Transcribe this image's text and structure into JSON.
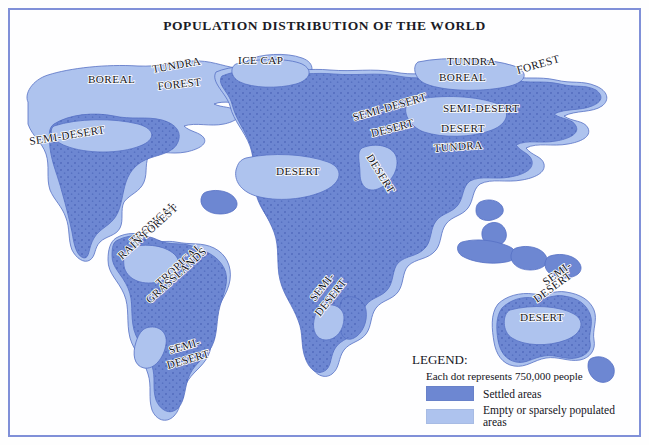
{
  "title": "POPULATION DISTRIBUTION OF THE WORLD",
  "colors": {
    "settled": "#6d87d2",
    "empty": "#aec3ee",
    "border": "#8090d8",
    "outline": "#5570c4",
    "dot": "#4a64b8",
    "background": "#fefeff",
    "text": "#14141c"
  },
  "legend": {
    "heading": "LEGEND:",
    "dot_note": "Each dot represents 750,000 people",
    "items": [
      {
        "label": "Settled areas",
        "color": "#6d87d2"
      },
      {
        "label": "Empty or sparsely populated areas",
        "color": "#aec3ee"
      }
    ]
  },
  "map_labels": [
    {
      "id": "na-boreal",
      "text": "BOREAL",
      "x": 78,
      "y": 41,
      "rot": 0,
      "size": "lg"
    },
    {
      "id": "na-tundra",
      "text": "TUNDRA",
      "x": 143,
      "y": 31,
      "rot": -10,
      "size": "lg"
    },
    {
      "id": "na-forest",
      "text": "FOREST",
      "x": 148,
      "y": 48,
      "rot": -6,
      "size": "lg"
    },
    {
      "id": "na-ice-cap",
      "text": "ICE CAP",
      "x": 228,
      "y": 22,
      "rot": 0,
      "size": "lg"
    },
    {
      "id": "na-semi-desert",
      "text": "SEMI-DESERT",
      "x": 20,
      "y": 103,
      "rot": -9,
      "size": "lg"
    },
    {
      "id": "sa-rain-forest",
      "text": "TROPICAL",
      "x": 124,
      "y": 203,
      "rot": -42,
      "size": "lg"
    },
    {
      "id": "sa-rain-forest-2",
      "text": "RAIN FOREST",
      "x": 112,
      "y": 218,
      "rot": -42,
      "size": "lg"
    },
    {
      "id": "sa-grasslands",
      "text": "TROPICAL",
      "x": 150,
      "y": 245,
      "rot": -42,
      "size": "lg"
    },
    {
      "id": "sa-grasslands-2",
      "text": "GRASSLANDS",
      "x": 140,
      "y": 262,
      "rot": -42,
      "size": "lg"
    },
    {
      "id": "sa-semi",
      "text": "SEMI-",
      "x": 160,
      "y": 312,
      "rot": -16,
      "size": "lg"
    },
    {
      "id": "sa-semi-2",
      "text": "DESERT",
      "x": 158,
      "y": 327,
      "rot": -16,
      "size": "lg"
    },
    {
      "id": "af-desert",
      "text": "DESERT",
      "x": 266,
      "y": 133,
      "rot": 0,
      "size": "lg"
    },
    {
      "id": "me-semi-desert",
      "text": "SEMI-DESERT",
      "x": 344,
      "y": 79,
      "rot": -16,
      "size": "lg"
    },
    {
      "id": "me-desert",
      "text": "DESERT",
      "x": 362,
      "y": 95,
      "rot": -14,
      "size": "lg"
    },
    {
      "id": "arabia-desert",
      "text": "DESERT",
      "x": 356,
      "y": 115,
      "rot": 58,
      "size": "lg"
    },
    {
      "id": "af-semi",
      "text": "SEMI-",
      "x": 305,
      "y": 260,
      "rot": -52,
      "size": "lg"
    },
    {
      "id": "af-semi-2",
      "text": "DESERT",
      "x": 310,
      "y": 275,
      "rot": -52,
      "size": "lg"
    },
    {
      "id": "as-tundra",
      "text": "TUNDRA",
      "x": 437,
      "y": 23,
      "rot": 0,
      "size": "lg"
    },
    {
      "id": "as-boreal",
      "text": "BOREAL",
      "x": 429,
      "y": 39,
      "rot": 0,
      "size": "lg"
    },
    {
      "id": "as-forest",
      "text": "FOREST",
      "x": 508,
      "y": 32,
      "rot": -16,
      "size": "lg"
    },
    {
      "id": "as-semi-desert",
      "text": "SEMI-DESERT",
      "x": 433,
      "y": 70,
      "rot": 0,
      "size": "lg"
    },
    {
      "id": "as-desert",
      "text": "DESERT",
      "x": 431,
      "y": 90,
      "rot": 0,
      "size": "lg"
    },
    {
      "id": "as-tundra-2",
      "text": "TUNDRA",
      "x": 424,
      "y": 110,
      "rot": -4,
      "size": "lg"
    },
    {
      "id": "au-semi",
      "text": "SEMI-",
      "x": 536,
      "y": 244,
      "rot": -36,
      "size": "lg"
    },
    {
      "id": "au-semi-2",
      "text": "DESERT",
      "x": 527,
      "y": 261,
      "rot": -36,
      "size": "lg"
    },
    {
      "id": "au-desert",
      "text": "DESERT",
      "x": 510,
      "y": 279,
      "rot": 0,
      "size": "lg"
    }
  ]
}
